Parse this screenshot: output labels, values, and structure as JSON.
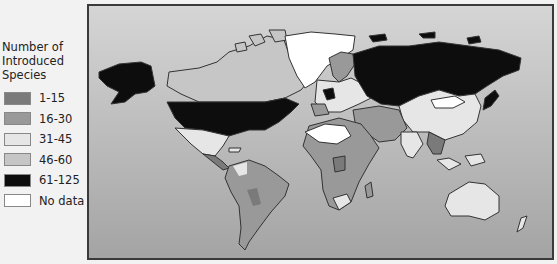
{
  "legend": {
    "title_lines": [
      "Number of",
      "Introduced",
      "Species"
    ],
    "items": [
      {
        "label": "1-15",
        "color": "#7a7a7a"
      },
      {
        "label": "16-30",
        "color": "#999999"
      },
      {
        "label": "31-45",
        "color": "#e6e6e6"
      },
      {
        "label": "46-60",
        "color": "#c6c6c6"
      },
      {
        "label": "61-125",
        "color": "#0d0d0d"
      },
      {
        "label": "No data",
        "color": "#ffffff"
      }
    ]
  },
  "map": {
    "type": "choropleth world map",
    "regions": [
      {
        "name": "United States",
        "category": "61-125"
      },
      {
        "name": "Alaska",
        "category": "61-125"
      },
      {
        "name": "Russia",
        "category": "61-125"
      },
      {
        "name": "Japan",
        "category": "61-125"
      },
      {
        "name": "Germany / Central Europe",
        "category": "61-125"
      },
      {
        "name": "Greenland",
        "category": "No data"
      },
      {
        "name": "Canada",
        "category": "46-60"
      },
      {
        "name": "Mexico",
        "category": "31-45"
      },
      {
        "name": "China",
        "category": "31-45"
      },
      {
        "name": "Australia",
        "category": "31-45"
      },
      {
        "name": "South Africa",
        "category": "31-45"
      },
      {
        "name": "Sahara region",
        "category": "No data"
      },
      {
        "name": "Mongolia",
        "category": "No data"
      },
      {
        "name": "South America",
        "category": "16-30"
      },
      {
        "name": "Central Africa",
        "category": "16-30"
      },
      {
        "name": "Middle East",
        "category": "16-30"
      },
      {
        "name": "Southeast Asia",
        "category": "1-15"
      }
    ]
  }
}
